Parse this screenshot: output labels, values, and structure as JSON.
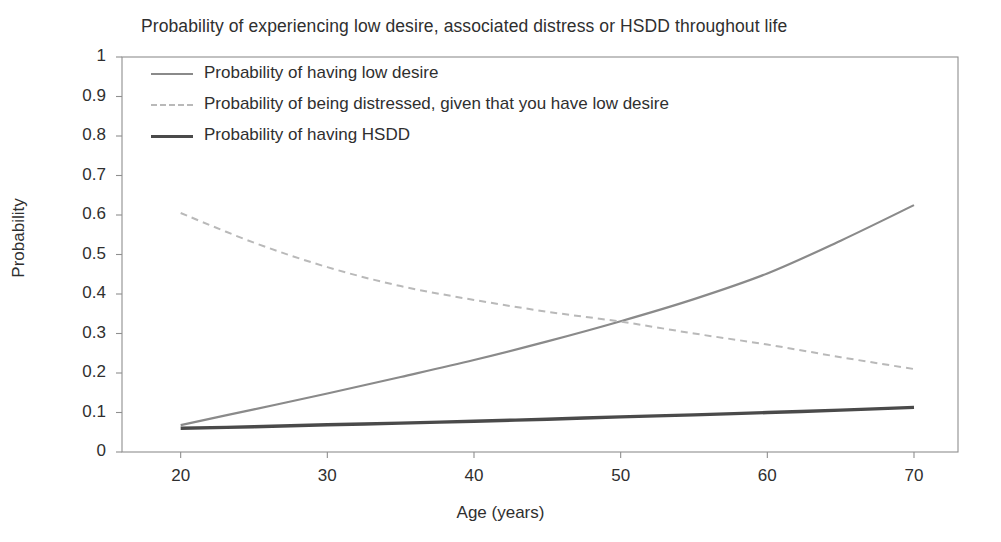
{
  "chart_data": {
    "type": "line",
    "title": "Probability of experiencing low desire, associated distress or HSDD throughout life",
    "xlabel": "Age (years)",
    "ylabel": "Probability",
    "xlim": [
      16,
      73
    ],
    "ylim": [
      0,
      1
    ],
    "grid": false,
    "legend_position": "top-left",
    "xticks": [
      20,
      30,
      40,
      50,
      60,
      70
    ],
    "xtick_labels": [
      "20",
      "30",
      "40",
      "50",
      "60",
      "70"
    ],
    "yticks": [
      0,
      0.1,
      0.2,
      0.3,
      0.4,
      0.5,
      0.6,
      0.7,
      0.8,
      0.9,
      1
    ],
    "ytick_labels": [
      "0",
      "0.1",
      "0.2",
      "0.3",
      "0.4",
      "0.5",
      "0.6",
      "0.7",
      "0.8",
      "0.9",
      "1"
    ],
    "x": [
      20,
      25,
      30,
      35,
      40,
      45,
      50,
      55,
      60,
      65,
      70
    ],
    "series": [
      {
        "name": "Probability of having low desire",
        "style": "solid",
        "color": "#8a8a8a",
        "width": 2.2,
        "values": [
          0.068,
          0.108,
          0.148,
          0.19,
          0.233,
          0.28,
          0.331,
          0.387,
          0.452,
          0.535,
          0.625
        ]
      },
      {
        "name": "Probability of being distressed, given that you have low desire",
        "style": "dashed",
        "color": "#b9b9b9",
        "width": 2.0,
        "values": [
          0.605,
          0.53,
          0.468,
          0.42,
          0.385,
          0.355,
          0.33,
          0.3,
          0.272,
          0.24,
          0.21
        ]
      },
      {
        "name": "Probability of having HSDD",
        "style": "solid",
        "color": "#4a4a4a",
        "width": 3.4,
        "values": [
          0.06,
          0.064,
          0.069,
          0.073,
          0.078,
          0.083,
          0.089,
          0.094,
          0.1,
          0.106,
          0.113
        ]
      }
    ]
  },
  "legend": {
    "items": [
      {
        "label": "Probability of having low desire"
      },
      {
        "label": "Probability of being distressed, given that you have low desire"
      },
      {
        "label": "Probability of having HSDD"
      }
    ]
  }
}
